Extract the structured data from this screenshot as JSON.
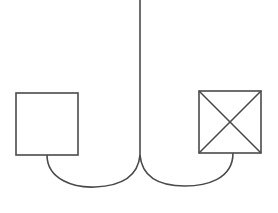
{
  "diagram": {
    "stroke_color": "#4a4a4a",
    "background": "#ffffff",
    "nodes": [
      {
        "id": "left-box",
        "type": "empty-square",
        "label": ""
      },
      {
        "id": "right-box",
        "type": "crossed-square",
        "label": ""
      }
    ],
    "edges": [
      {
        "from": "stem",
        "to": "left-box"
      },
      {
        "from": "stem",
        "to": "right-box"
      }
    ]
  }
}
